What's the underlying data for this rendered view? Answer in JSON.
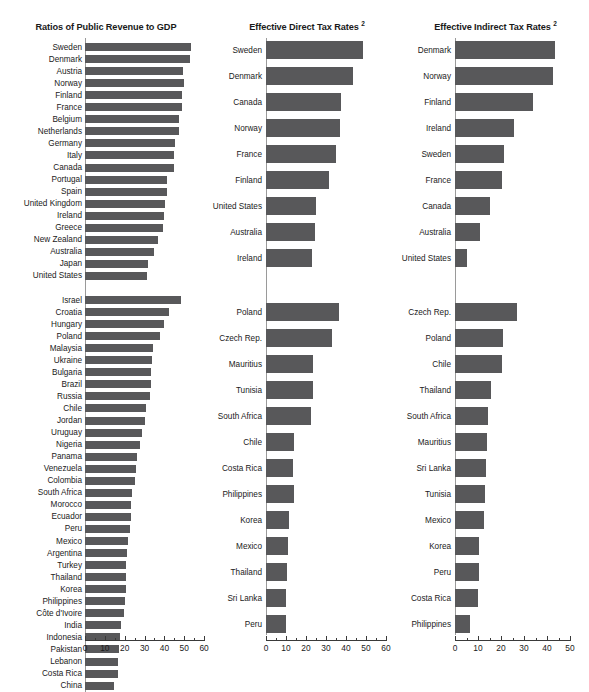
{
  "chart_data": [
    {
      "type": "bar",
      "orientation": "horizontal",
      "title": "Ratios of Public Revenue to GDP",
      "title_superscript": "",
      "xlabel": "",
      "ylabel": "",
      "xlim": [
        0,
        62
      ],
      "xticks": [
        0,
        10,
        20,
        30,
        40,
        50,
        60
      ],
      "grid": false,
      "legend": "none",
      "groups": [
        {
          "name": "industrial",
          "categories": [
            "Sweden",
            "Denmark",
            "Austria",
            "Norway",
            "Finland",
            "France",
            "Belgium",
            "Netherlands",
            "Germany",
            "Italy",
            "Canada",
            "Portugal",
            "Spain",
            "United Kingdom",
            "Ireland",
            "Greece",
            "New Zealand",
            "Australia",
            "Japan",
            "United States"
          ],
          "values": [
            53.5,
            53.0,
            49.5,
            49.7,
            48.8,
            48.8,
            47.5,
            47.3,
            45.2,
            45.0,
            44.8,
            41.5,
            41.2,
            40.5,
            39.8,
            39.5,
            37.0,
            35.0,
            31.8,
            31.0
          ]
        },
        {
          "name": "developing",
          "categories": [
            "Israel",
            "Croatia",
            "Hungary",
            "Poland",
            "Malaysia",
            "Ukraine",
            "Bulgaria",
            "Brazil",
            "Russia",
            "Chile",
            "Jordan",
            "Uruguay",
            "Nigeria",
            "Panama",
            "Venezuela",
            "Colombia",
            "South Africa",
            "Morocco",
            "Ecuador",
            "Peru",
            "Mexico",
            "Argentina",
            "Turkey",
            "Thailand",
            "Korea",
            "Philippines",
            "Côte d'Ivoire",
            "India",
            "Indonesia",
            "Pakistan",
            "Lebanon",
            "Costa Rica",
            "China"
          ],
          "values": [
            48.5,
            42.5,
            40.0,
            38.0,
            34.5,
            34.0,
            33.5,
            33.0,
            32.5,
            30.5,
            30.0,
            28.5,
            27.5,
            26.0,
            25.5,
            25.0,
            23.5,
            23.2,
            23.0,
            22.8,
            21.5,
            21.0,
            20.8,
            20.7,
            20.5,
            20.0,
            19.8,
            18.0,
            17.5,
            17.0,
            16.8,
            16.5,
            14.5
          ]
        }
      ]
    },
    {
      "type": "bar",
      "orientation": "horizontal",
      "title": "Effective Direct Tax Rates",
      "title_superscript": "2",
      "xlabel": "",
      "ylabel": "",
      "xlim": [
        0,
        62
      ],
      "xticks": [
        0,
        10,
        20,
        30,
        40,
        50,
        60
      ],
      "grid": false,
      "legend": "none",
      "groups": [
        {
          "name": "industrial",
          "categories": [
            "Sweden",
            "Denmark",
            "Canada",
            "Norway",
            "France",
            "Finland",
            "United States",
            "Australia",
            "Ireland"
          ],
          "values": [
            48.5,
            43.5,
            37.5,
            37.0,
            35.0,
            31.5,
            25.0,
            24.5,
            23.0
          ]
        },
        {
          "name": "developing",
          "categories": [
            "Poland",
            "Czech Rep.",
            "Mauritius",
            "Tunisia",
            "South Africa",
            "Chile",
            "Costa Rica",
            "Philippines",
            "Korea",
            "Mexico",
            "Thailand",
            "Sri Lanka",
            "Peru"
          ],
          "values": [
            36.5,
            33.0,
            23.5,
            23.5,
            22.5,
            14.0,
            13.5,
            14.0,
            11.5,
            11.0,
            10.5,
            10.0,
            10.0
          ]
        }
      ]
    },
    {
      "type": "bar",
      "orientation": "horizontal",
      "title": "Effective Indirect Tax Rates",
      "title_superscript": "2",
      "xlabel": "",
      "ylabel": "",
      "xlim": [
        0,
        52
      ],
      "xticks": [
        0,
        10,
        20,
        30,
        40,
        50
      ],
      "grid": false,
      "legend": "none",
      "groups": [
        {
          "name": "industrial",
          "categories": [
            "Denmark",
            "Norway",
            "Finland",
            "Ireland",
            "Sweden",
            "France",
            "Canada",
            "Australia",
            "United States"
          ],
          "values": [
            43.5,
            42.5,
            34.0,
            25.5,
            21.5,
            20.5,
            15.0,
            11.0,
            5.0
          ]
        },
        {
          "name": "developing",
          "categories": [
            "Czech Rep.",
            "Poland",
            "Chile",
            "Thailand",
            "South Africa",
            "Mauritius",
            "Sri Lanka",
            "Tunisia",
            "Mexico",
            "Korea",
            "Peru",
            "Costa Rica",
            "Philippines"
          ],
          "values": [
            27.0,
            21.0,
            20.5,
            15.5,
            14.5,
            14.0,
            13.5,
            13.0,
            12.5,
            10.5,
            10.5,
            10.0,
            6.5
          ]
        }
      ]
    }
  ]
}
